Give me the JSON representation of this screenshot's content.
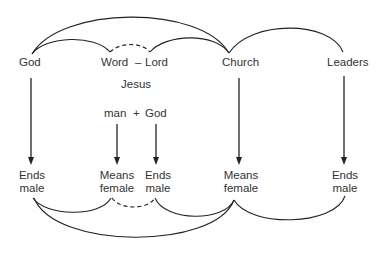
{
  "diagram": {
    "top_nodes": {
      "god": "God",
      "word": "Word",
      "dash": "–",
      "lord": "Lord",
      "church": "Church",
      "leaders": "Leaders"
    },
    "middle": {
      "jesus": "Jesus",
      "man": "man",
      "plus": "+",
      "god": "God"
    },
    "bottom_nodes": [
      {
        "line1": "Ends",
        "line2": "male"
      },
      {
        "line1": "Means",
        "line2": "female"
      },
      {
        "line1": "Ends",
        "line2": "male"
      },
      {
        "line1": "Means",
        "line2": "female"
      },
      {
        "line1": "Ends",
        "line2": "male"
      }
    ],
    "edges": [
      {
        "from": "God",
        "to": "Ends male (1)",
        "type": "arrow"
      },
      {
        "from": "man",
        "to": "Means female (2)",
        "type": "arrow"
      },
      {
        "from": "God (Jesus)",
        "to": "Ends male (3)",
        "type": "arrow"
      },
      {
        "from": "Church",
        "to": "Means female (4)",
        "type": "arrow"
      },
      {
        "from": "Leaders",
        "to": "Ends male (5)",
        "type": "arrow"
      },
      {
        "from": "God",
        "to": "Word",
        "type": "arc"
      },
      {
        "from": "Word",
        "to": "Lord",
        "type": "dashed-arc"
      },
      {
        "from": "Lord",
        "to": "Church",
        "type": "arc"
      },
      {
        "from": "God",
        "to": "Church",
        "type": "arc"
      },
      {
        "from": "Church",
        "to": "Leaders",
        "type": "arc"
      },
      {
        "from": "Ends male (1)",
        "to": "Means female (2)",
        "type": "arc"
      },
      {
        "from": "Means female (2)",
        "to": "Ends male (3)",
        "type": "dashed-arc"
      },
      {
        "from": "Ends male (3)",
        "to": "Means female (4)",
        "type": "arc"
      },
      {
        "from": "Ends male (1)",
        "to": "Means female (4)",
        "type": "arc"
      },
      {
        "from": "Means female (4)",
        "to": "Ends male (5)",
        "type": "arc"
      }
    ]
  }
}
